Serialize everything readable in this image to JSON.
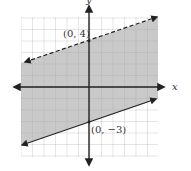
{
  "graph": {
    "type": "linear-inequality-graph",
    "x_axis_label": "x",
    "y_axis_label": "y",
    "x_range": [
      -6,
      6
    ],
    "y_range": [
      -6,
      6
    ],
    "grid": true,
    "shade_color": "#c9c9c9",
    "line_color": "#222222",
    "grid_color": "#9a9a9a"
  },
  "boundaries": [
    {
      "name": "upper",
      "style": "dashed",
      "slope": 0.3333,
      "intercept": 4,
      "label": "(0, 4)"
    },
    {
      "name": "lower",
      "style": "solid",
      "slope": 0.3333,
      "intercept": -3,
      "label": "(0, −3)"
    }
  ],
  "labels": {
    "upper_point": "(0, 4)",
    "lower_point": "(0, −3)",
    "x": "x",
    "y": "y"
  }
}
